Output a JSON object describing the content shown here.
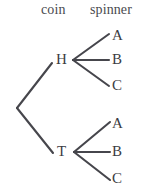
{
  "diagram": {
    "type": "probability-tree-diagram",
    "title": "",
    "columns": [
      {
        "id": "coin",
        "label": "coin"
      },
      {
        "id": "spinner",
        "label": "spinner"
      }
    ],
    "colors": {
      "edge": "#46464c",
      "text": "#3c3c42",
      "header_text": "#4a4a4f",
      "background": "#ffffff"
    },
    "root": {
      "x": 17,
      "y": 108
    },
    "nodes": [
      {
        "id": "H",
        "label": "H",
        "level": 1,
        "x": 63,
        "y": 60,
        "label_left": 56,
        "label_top": 52
      },
      {
        "id": "T",
        "label": "T",
        "level": 1,
        "x": 63,
        "y": 152,
        "label_left": 57,
        "label_top": 144
      },
      {
        "id": "H-A",
        "label": "A",
        "level": 2,
        "parent": "H",
        "x": 112,
        "y": 36,
        "label_left": 112,
        "label_top": 28
      },
      {
        "id": "H-B",
        "label": "B",
        "level": 2,
        "parent": "H",
        "x": 112,
        "y": 60,
        "label_left": 112,
        "label_top": 52
      },
      {
        "id": "H-C",
        "label": "C",
        "level": 2,
        "parent": "H",
        "x": 112,
        "y": 86,
        "label_left": 112,
        "label_top": 78
      },
      {
        "id": "T-A",
        "label": "A",
        "level": 2,
        "parent": "T",
        "x": 112,
        "y": 124,
        "label_left": 112,
        "label_top": 116
      },
      {
        "id": "T-B",
        "label": "B",
        "level": 2,
        "parent": "T",
        "x": 112,
        "y": 152,
        "label_left": 112,
        "label_top": 144
      },
      {
        "id": "T-C",
        "label": "C",
        "level": 2,
        "parent": "T",
        "x": 112,
        "y": 179,
        "label_left": 112,
        "label_top": 171
      }
    ],
    "edges": [
      {
        "id": "root-H",
        "from": "root",
        "to": "H",
        "x1": 17,
        "y1": 108,
        "x2": 52,
        "y2": 63
      },
      {
        "id": "root-T",
        "from": "root",
        "to": "T",
        "x1": 17,
        "y1": 108,
        "x2": 53,
        "y2": 153
      },
      {
        "id": "H-A",
        "from": "H",
        "to": "H-A",
        "x1": 73,
        "y1": 60,
        "x2": 109,
        "y2": 34
      },
      {
        "id": "H-B",
        "from": "H",
        "to": "H-B",
        "x1": 73,
        "y1": 60,
        "x2": 109,
        "y2": 60
      },
      {
        "id": "H-C",
        "from": "H",
        "to": "H-C",
        "x1": 73,
        "y1": 60,
        "x2": 109,
        "y2": 86
      },
      {
        "id": "T-A",
        "from": "T",
        "to": "T-A",
        "x1": 74,
        "y1": 152,
        "x2": 110,
        "y2": 122
      },
      {
        "id": "T-B",
        "from": "T",
        "to": "T-B",
        "x1": 74,
        "y1": 152,
        "x2": 110,
        "y2": 152
      },
      {
        "id": "T-C",
        "from": "T",
        "to": "T-C",
        "x1": 74,
        "y1": 152,
        "x2": 110,
        "y2": 180
      }
    ]
  }
}
